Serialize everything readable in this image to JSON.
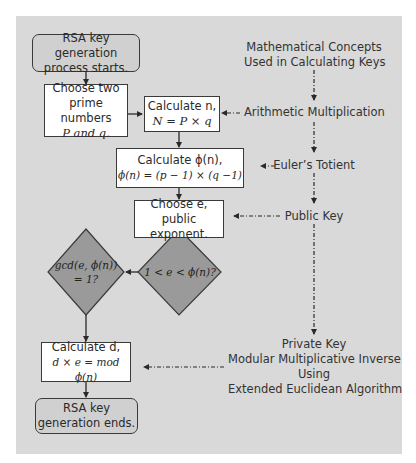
{
  "diagram": {
    "colors": {
      "panel_background": "#d9d9d9",
      "process_box": "#ffffff",
      "terminal_box": "#d0d0d0",
      "decision_diamond": "#9a9a9a",
      "line": "#2a2a2a"
    },
    "nodes": {
      "start": {
        "type": "terminal",
        "line1": "RSA key generation",
        "line2": "process starts."
      },
      "choose_primes": {
        "type": "process",
        "line1": "Choose two",
        "line2": "prime numbers",
        "line3": "P and q."
      },
      "calc_n": {
        "type": "process",
        "line1": "Calculate n,",
        "line2": "N = P × q"
      },
      "calc_phi": {
        "type": "process",
        "line1": "Calculate ϕ(n),",
        "line2": "ϕ(n) = (p − 1) × (q −1)"
      },
      "choose_e": {
        "type": "process",
        "line1": "Choose e,",
        "line2": "public exponent."
      },
      "decision_range": {
        "type": "decision",
        "text": "1 < e < ϕ(n)?"
      },
      "decision_gcd": {
        "type": "decision",
        "line1": "gcd(e, ϕ(n))",
        "line2": "= 1?"
      },
      "calc_d": {
        "type": "process",
        "line1": "Calculate d,",
        "line2": "d × e = mod ϕ(n)"
      },
      "end": {
        "type": "terminal",
        "line1": "RSA key",
        "line2": "generation ends."
      }
    },
    "concepts": {
      "header_line1": "Mathematical Concepts",
      "header_line2": "Used in Calculating Keys",
      "arithmetic": "Arithmetic Multiplication",
      "euler": "Euler’s Totient",
      "public_key": "Public Key",
      "private_line1": "Private Key",
      "private_line2": "Modular Multiplicative Inverse",
      "private_line3": "Using",
      "private_line4": "Extended Euclidean Algorithm"
    },
    "edges": [
      {
        "from": "start",
        "to": "choose_primes",
        "style": "solid"
      },
      {
        "from": "choose_primes",
        "to": "calc_n",
        "style": "solid"
      },
      {
        "from": "calc_n",
        "to": "calc_phi",
        "style": "solid"
      },
      {
        "from": "calc_phi",
        "to": "choose_e",
        "style": "solid"
      },
      {
        "from": "choose_e",
        "to": "decision_range",
        "style": "solid"
      },
      {
        "from": "decision_range",
        "to": "decision_gcd",
        "style": "solid"
      },
      {
        "from": "decision_gcd",
        "to": "calc_d",
        "style": "solid"
      },
      {
        "from": "calc_d",
        "to": "end",
        "style": "solid"
      },
      {
        "from": "arithmetic",
        "to": "calc_n",
        "style": "dashed"
      },
      {
        "from": "euler",
        "to": "calc_phi",
        "style": "dashed"
      },
      {
        "from": "public_key",
        "to": "choose_e",
        "style": "dashed"
      },
      {
        "from": "private_key",
        "to": "calc_d",
        "style": "dashed"
      }
    ]
  }
}
